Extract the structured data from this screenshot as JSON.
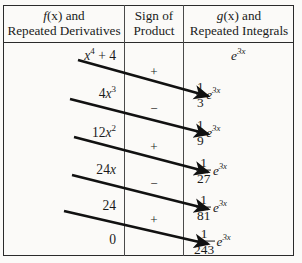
{
  "figure": {
    "type": "table",
    "background_color": "#fbfaf8",
    "rule_color": "#2b2b2b"
  },
  "headers": {
    "left": {
      "line1_fn": "f",
      "line1_arg": "(x)",
      "line1_tail": " and",
      "line2": "Repeated Derivatives"
    },
    "middle": {
      "line1": "Sign of",
      "line2": "Product"
    },
    "right": {
      "line1_fn": "g",
      "line1_arg": "(x)",
      "line1_tail": " and",
      "line2": "Repeated Integrals"
    }
  },
  "columns": {
    "left_header_plain": "f(x) and Repeated Derivatives",
    "middle_header_plain": "Sign of Product",
    "right_header_plain": "g(x) and Repeated Integrals"
  },
  "rows": [
    {
      "index": 0,
      "derivative": {
        "plain": "x^4 + 4",
        "base": "x",
        "exp": "4",
        "tail": " + 4"
      },
      "sign": "+",
      "integral": {
        "plain": "e^{3x}",
        "numerator": "",
        "denominator": "",
        "exp_factor": "e",
        "exp_power": "3x",
        "is_fraction": false
      }
    },
    {
      "index": 1,
      "derivative": {
        "plain": "4x^3",
        "coef": "4",
        "base": "x",
        "exp": "3",
        "tail": ""
      },
      "sign": "−",
      "integral": {
        "plain": "(1/3) e^{3x}",
        "numerator": "1",
        "denominator": "3",
        "exp_factor": "e",
        "exp_power": "3x",
        "is_fraction": true
      }
    },
    {
      "index": 2,
      "derivative": {
        "plain": "12x^2",
        "coef": "12",
        "base": "x",
        "exp": "2",
        "tail": ""
      },
      "sign": "+",
      "integral": {
        "plain": "(1/9) e^{3x}",
        "numerator": "1",
        "denominator": "9",
        "exp_factor": "e",
        "exp_power": "3x",
        "is_fraction": true
      }
    },
    {
      "index": 3,
      "derivative": {
        "plain": "24x",
        "coef": "24",
        "base": "x",
        "exp": "",
        "tail": ""
      },
      "sign": "−",
      "integral": {
        "plain": "(1/27) e^{3x}",
        "numerator": "1",
        "denominator": "27",
        "exp_factor": "e",
        "exp_power": "3x",
        "is_fraction": true
      }
    },
    {
      "index": 4,
      "derivative": {
        "plain": "24",
        "coef": "24",
        "base": "",
        "exp": "",
        "tail": ""
      },
      "sign": "+",
      "integral": {
        "plain": "(1/81) e^{3x}",
        "numerator": "1",
        "denominator": "81",
        "exp_factor": "e",
        "exp_power": "3x",
        "is_fraction": true
      }
    },
    {
      "index": 5,
      "derivative": {
        "plain": "0",
        "coef": "0",
        "base": "",
        "exp": "",
        "tail": ""
      },
      "sign": "",
      "integral": {
        "plain": "(1/243) e^{3x}",
        "numerator": "1",
        "denominator": "243",
        "exp_factor": "e",
        "exp_power": "3x",
        "is_fraction": true
      }
    }
  ],
  "arrows": [
    {
      "from_row": 0,
      "to_row": 1,
      "label": "diagonal-arrow"
    },
    {
      "from_row": 1,
      "to_row": 2,
      "label": "diagonal-arrow"
    },
    {
      "from_row": 2,
      "to_row": 3,
      "label": "diagonal-arrow"
    },
    {
      "from_row": 3,
      "to_row": 4,
      "label": "diagonal-arrow"
    },
    {
      "from_row": 4,
      "to_row": 5,
      "label": "diagonal-arrow"
    }
  ],
  "signs_sequence": [
    "+",
    "−",
    "+",
    "−",
    "+"
  ]
}
